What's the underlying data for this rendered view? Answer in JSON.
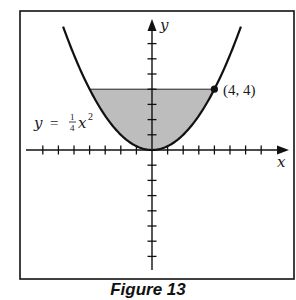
{
  "figure": {
    "caption": "Figure 13",
    "axis_labels": {
      "x": "x",
      "y": "y"
    },
    "curve_label": {
      "lhs": "y",
      "eq": "=",
      "frac_num": "1",
      "frac_den": "4",
      "var": "x",
      "exp": "2"
    },
    "point_label": "(4, 4)",
    "colors": {
      "shade": "#bdbdbd",
      "ink": "#111111",
      "frame": "#111111"
    }
  },
  "chart_data": {
    "type": "line",
    "title": "Figure 13",
    "xlabel": "x",
    "ylabel": "y",
    "curve": "y = (1/4) x^2",
    "xlim": [
      -7.5,
      8.5
    ],
    "ylim": [
      -8,
      8.5
    ],
    "x_ticks": [
      -7,
      -6,
      -5,
      -4,
      -3,
      -2,
      -1,
      1,
      2,
      3,
      4,
      5,
      6,
      7
    ],
    "y_ticks": [
      -7,
      -6,
      -5,
      -4,
      -3,
      -2,
      -1,
      1,
      2,
      3,
      4,
      5,
      6,
      7
    ],
    "tick_labels_shown": false,
    "grid": false,
    "series": [
      {
        "name": "y = 1/4 x^2",
        "x": [
          -5.7,
          -4,
          -3,
          -2,
          -1,
          0,
          1,
          2,
          3,
          4,
          5.7
        ],
        "values": [
          8.12,
          4,
          2.25,
          1,
          0.25,
          0,
          0.25,
          1,
          2.25,
          4,
          8.12
        ]
      }
    ],
    "shaded_region": {
      "description": "region between y = 1/4 x^2 and y = 4",
      "x_range": [
        -4,
        4
      ],
      "upper": 4
    },
    "annotations": [
      {
        "text": "(4, 4)",
        "x": 4,
        "y": 4,
        "marker": "filled-dot"
      },
      {
        "text": "y = 1/4 x^2",
        "position": "left of curve"
      }
    ]
  }
}
